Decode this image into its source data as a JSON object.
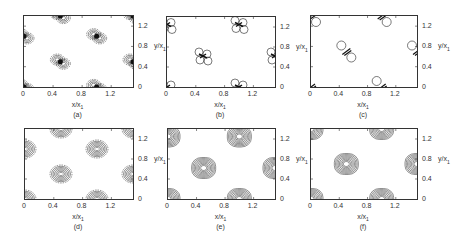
{
  "chart_data": [
    {
      "panel": "a",
      "type": "heatmap",
      "title": "(a)",
      "xlabel": "x/x1",
      "ylabel": "y/x1",
      "xlim": [
        0,
        1.5
      ],
      "ylim": [
        0,
        1.4
      ],
      "xticks": [
        "0",
        "0.4",
        "0.8",
        "1.2"
      ],
      "yticks": [
        "0",
        "0.4",
        "0.8",
        "1.2"
      ],
      "grid": false,
      "ylabel_side": "right",
      "style": "four-lobe dense",
      "centers": [
        [
          0,
          0
        ],
        [
          0.5,
          0.5
        ],
        [
          1.0,
          0
        ],
        [
          1.0,
          1.0
        ],
        [
          0,
          1.0
        ],
        [
          1.5,
          0.5
        ],
        [
          0.5,
          1.4
        ],
        [
          1.5,
          1.4
        ]
      ]
    },
    {
      "panel": "b",
      "type": "heatmap",
      "title": "(b)",
      "xlabel": "x/x1",
      "ylabel": "y/x1",
      "xlim": [
        0,
        1.5
      ],
      "ylim": [
        0,
        1.4
      ],
      "xticks": [
        "0",
        "0.4",
        "0.8",
        "1.2"
      ],
      "yticks": [
        "0",
        "0.4",
        "0.8",
        "1.2"
      ],
      "grid": false,
      "ylabel_side": "left+right",
      "style": "four-lobe open circles",
      "centers": [
        [
          0,
          0
        ],
        [
          0.5,
          0.62
        ],
        [
          1.0,
          0
        ],
        [
          1.0,
          1.25
        ],
        [
          0,
          1.25
        ],
        [
          1.5,
          0.62
        ]
      ]
    },
    {
      "panel": "c",
      "type": "heatmap",
      "title": "(c)",
      "xlabel": "x/x1",
      "ylabel": "y/x1",
      "xlim": [
        0,
        1.5
      ],
      "ylim": [
        0,
        1.4
      ],
      "xticks": [
        "0",
        "0.4",
        "0.8",
        "1.2"
      ],
      "yticks": [
        "0",
        "0.4",
        "0.8",
        "1.2"
      ],
      "grid": false,
      "ylabel_side": "left+right",
      "style": "two-lobe diagonal",
      "centers": [
        [
          0,
          0
        ],
        [
          0.5,
          0.7
        ],
        [
          1.0,
          0
        ],
        [
          1.0,
          1.4
        ],
        [
          0,
          1.4
        ],
        [
          1.5,
          0.7
        ]
      ]
    },
    {
      "panel": "d",
      "type": "heatmap",
      "title": "(d)",
      "xlabel": "x/x1",
      "ylabel": "y/x1",
      "xlim": [
        0,
        1.5
      ],
      "ylim": [
        0,
        1.4
      ],
      "xticks": [
        "0",
        "0.4",
        "0.8",
        "1.2"
      ],
      "yticks": [
        "0",
        "0.4",
        "0.8",
        "1.2"
      ],
      "grid": false,
      "ylabel_side": "right",
      "style": "concentric ellipses",
      "centers": [
        [
          0,
          0
        ],
        [
          0.5,
          0.5
        ],
        [
          1.0,
          0
        ],
        [
          1.0,
          1.0
        ],
        [
          0,
          1.0
        ],
        [
          1.5,
          0.5
        ],
        [
          0.5,
          1.4
        ],
        [
          1.5,
          1.4
        ]
      ]
    },
    {
      "panel": "e",
      "type": "heatmap",
      "title": "(e)",
      "xlabel": "x/x1",
      "ylabel": "y/x1",
      "xlim": [
        0,
        1.5
      ],
      "ylim": [
        0,
        1.4
      ],
      "xticks": [
        "0",
        "0.4",
        "0.8",
        "1.2"
      ],
      "yticks": [
        "0",
        "0.4",
        "0.8",
        "1.2"
      ],
      "grid": false,
      "ylabel_side": "left+right",
      "style": "concentric rounded squares",
      "centers": [
        [
          0,
          0
        ],
        [
          0.5,
          0.62
        ],
        [
          1.0,
          0
        ],
        [
          1.0,
          1.25
        ],
        [
          0,
          1.25
        ],
        [
          1.5,
          0.62
        ]
      ]
    },
    {
      "panel": "f",
      "type": "heatmap",
      "title": "(f)",
      "xlabel": "x/x1",
      "ylabel": "y/x1",
      "xlim": [
        0,
        1.5
      ],
      "ylim": [
        0,
        1.4
      ],
      "xticks": [
        "0",
        "0.4",
        "0.8",
        "1.2"
      ],
      "yticks": [
        "0",
        "0.4",
        "0.8",
        "1.2"
      ],
      "grid": false,
      "ylabel_side": "left+right",
      "style": "concentric rounded squares",
      "centers": [
        [
          0,
          0
        ],
        [
          0.5,
          0.7
        ],
        [
          1.0,
          0
        ],
        [
          1.0,
          1.4
        ],
        [
          0,
          1.4
        ],
        [
          1.5,
          0.7
        ]
      ]
    }
  ],
  "labels": {
    "xtick0": "0",
    "xtick1": "0.4",
    "xtick2": "0.8",
    "xtick3": "1.2",
    "ytick0": "0",
    "ytick1": "0.4",
    "ytick2": "0.8",
    "ytick3": "1.2",
    "xlabel_main": "x/x",
    "ylabel_main": "y/x",
    "sub": "1",
    "pa": "(a)",
    "pb": "(b)",
    "pc": "(c)",
    "pd": "(d)",
    "pe": "(e)",
    "pf": "(f)"
  }
}
